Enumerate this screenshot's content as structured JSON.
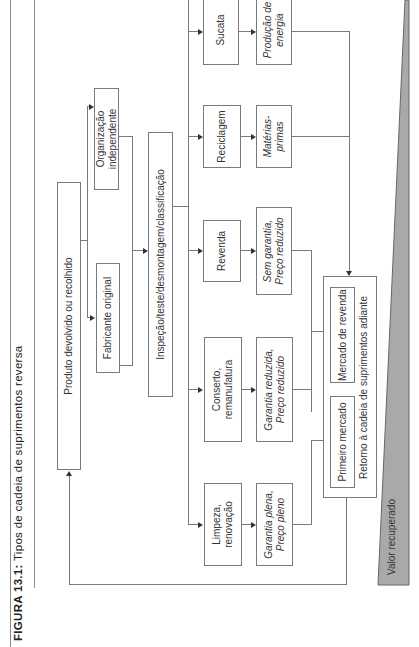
{
  "figure": {
    "label": "FIGURA 13.1:",
    "title": "Tipos de cadeia de suprimentos reversa"
  },
  "nodes": {
    "produto": "Produto devolvido ou recolhido",
    "fabricante": "Fabricante original",
    "organizacao": "Organização independente",
    "inspecao": "Inspeção/teste/desmontagem/classificação",
    "options": [
      {
        "action": [
          "Limpeza,",
          "renovação"
        ],
        "outcome": [
          "Garantia plena,",
          "Preço pleno"
        ]
      },
      {
        "action": [
          "Conserto,",
          "remanufatura"
        ],
        "outcome": [
          "Garantia reduzida,",
          "Preço reduzido"
        ]
      },
      {
        "action": [
          "Revenda"
        ],
        "outcome": [
          "Sem garantia,",
          "Preço reduzido"
        ]
      },
      {
        "action": [
          "Reciclagem"
        ],
        "outcome": [
          "Matérias-",
          "primas"
        ]
      },
      {
        "action": [
          "Sucata"
        ],
        "outcome": [
          "Produção de",
          "energia"
        ]
      }
    ],
    "retorno": {
      "label": "Retorno à cadeia de suprimentos adiante",
      "primeiro_mercado": "Primeiro mercado",
      "mercado_revenda": "Mercado de revenda"
    }
  },
  "value_wedge": {
    "label": "Valor recuperado",
    "color": "#a9a9a9"
  }
}
